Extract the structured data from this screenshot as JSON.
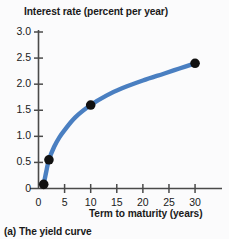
{
  "figure": {
    "caption": "(a) The yield curve",
    "title_top": "Interest rate (percent per year)",
    "title_bottom": "Term to maturity (years)"
  },
  "colors": {
    "curve": "#4a7fc1",
    "marker": "#111111",
    "axis": "#4a4a4a",
    "background": "#fbfbfc",
    "text": "#1a1a1a"
  },
  "chart_data": {
    "type": "line",
    "title": "Interest rate (percent per year)",
    "xlabel": "Term to maturity (years)",
    "ylabel": "Interest rate (percent per year)",
    "caption": "(a) The yield curve",
    "xlim": [
      0,
      32
    ],
    "ylim": [
      0,
      3.0
    ],
    "xticks": [
      0,
      5,
      10,
      15,
      20,
      25,
      30
    ],
    "xtick_labels": [
      "0",
      "5",
      "10",
      "15",
      "20",
      "25",
      "30"
    ],
    "yticks": [
      0,
      0.5,
      1.0,
      1.5,
      2.0,
      2.5,
      3.0
    ],
    "ytick_labels": [
      "0",
      "0.5",
      "1.0",
      "1.5",
      "2.0",
      "2.5",
      "3.0"
    ],
    "grid": false,
    "legend": null,
    "series": [
      {
        "name": "Yield curve",
        "markers": true,
        "x": [
          1,
          2,
          10,
          30
        ],
        "y": [
          0.08,
          0.55,
          1.6,
          2.4
        ],
        "curve_x": [
          1,
          1.5,
          2,
          3,
          4,
          5,
          7,
          10,
          13,
          16,
          20,
          24,
          27,
          30
        ],
        "curve_y": [
          0.08,
          0.33,
          0.55,
          0.8,
          0.98,
          1.12,
          1.36,
          1.6,
          1.78,
          1.92,
          2.07,
          2.2,
          2.3,
          2.4
        ]
      }
    ]
  }
}
